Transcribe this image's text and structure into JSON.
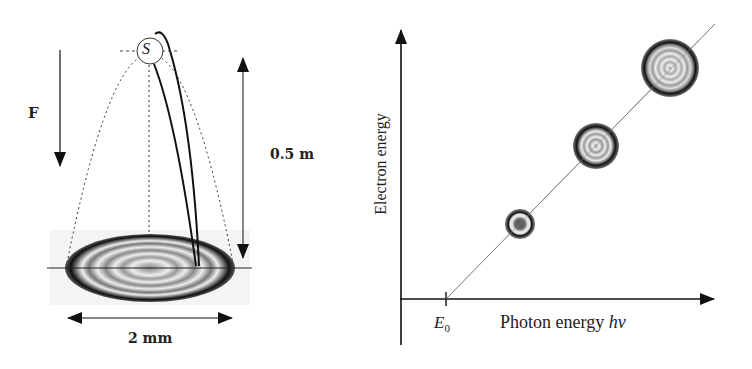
{
  "left_panel": {
    "force_label": "F",
    "source_label": "S",
    "height_label": "0.5 m",
    "width_label": "2 mm"
  },
  "right_panel": {
    "y_axis_label": "Electron energy",
    "x_axis_label": "Photon energy ",
    "x_axis_symbol": "hν",
    "threshold_label": "E",
    "threshold_subscript": "0"
  }
}
